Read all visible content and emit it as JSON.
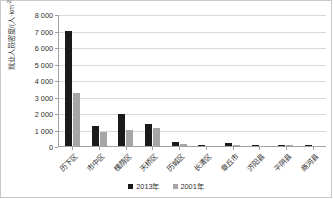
{
  "chart_data": {
    "type": "bar",
    "title": "",
    "xlabel": "",
    "ylabel": "就业人员密度/(人·km",
    "ylabel_sup": "-2",
    "ylabel_tail": ")",
    "ylim": [
      0,
      8000
    ],
    "ytick_step": 1000,
    "grid": true,
    "legend_position": "bottom",
    "ytick_labels": [
      "8 000",
      "7 000",
      "6 000",
      "5 000",
      "4 000",
      "3 000",
      "2 000",
      "1 000",
      "0"
    ],
    "categories": [
      "历下区",
      "市中区",
      "槐荫区",
      "天桥区",
      "历城区",
      "长清区",
      "章丘市",
      "济阳县",
      "平阴县",
      "商河县"
    ],
    "series": [
      {
        "name": "2013年",
        "color": "#1a1a1a",
        "values": [
          7050,
          1250,
          1950,
          1320,
          230,
          75,
          165,
          70,
          90,
          45
        ]
      },
      {
        "name": "2001年",
        "color": "#a6a6a6",
        "values": [
          3250,
          850,
          1000,
          1070,
          110,
          25,
          45,
          20,
          35,
          15
        ]
      }
    ]
  },
  "colors": {
    "series_2013": "#1a1a1a",
    "series_2001": "#a6a6a6",
    "gridline": "#d9d9d9",
    "axis": "#a0a0a0",
    "border": "#c9c9c9",
    "text": "#2f2f2f",
    "background": "#ffffff"
  }
}
